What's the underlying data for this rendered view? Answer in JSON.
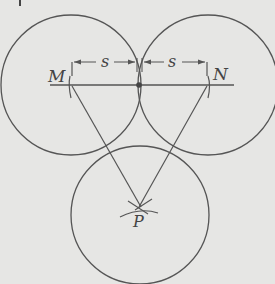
{
  "diagram": {
    "colors": {
      "background": "#e6e6e4",
      "stroke": "#555555"
    },
    "points": {
      "M": {
        "label": "M",
        "x": 71,
        "y": 85
      },
      "N": {
        "label": "N",
        "x": 208,
        "y": 85
      },
      "P": {
        "label": "P",
        "x": 140,
        "y": 208
      },
      "center": {
        "x": 139,
        "y": 85
      }
    },
    "circles": [
      {
        "name": "left-circle",
        "cx": 71,
        "cy": 85,
        "r": 70
      },
      {
        "name": "right-circle",
        "cx": 208,
        "cy": 85,
        "r": 70
      },
      {
        "name": "bottom-circle",
        "cx": 140,
        "cy": 215,
        "r": 69
      }
    ],
    "dimensions": [
      {
        "label": "s",
        "from": "M",
        "to": "center"
      },
      {
        "label": "s",
        "from": "center",
        "to": "N"
      }
    ],
    "corner_fragment": "Γ"
  }
}
